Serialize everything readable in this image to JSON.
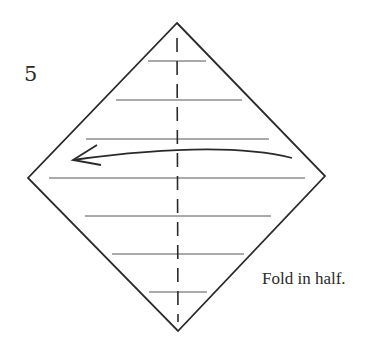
{
  "step": {
    "number": "5"
  },
  "caption": {
    "text": "Fold in half."
  },
  "diagram": {
    "shape": "diamond",
    "vertices": {
      "top": [
        177,
        23
      ],
      "right": [
        325,
        176
      ],
      "bottom": [
        178,
        331
      ],
      "left": [
        28,
        178
      ]
    },
    "crease_lines_y": [
      64,
      100,
      139,
      178,
      216,
      255,
      293
    ],
    "fold_line": "vertical-dashed-center",
    "arrow": {
      "direction": "left",
      "from": [
        292,
        158
      ],
      "to": [
        73,
        160
      ]
    },
    "colors": {
      "line": "#2a2a2a",
      "crease": "#555555",
      "background": "#ffffff"
    }
  }
}
